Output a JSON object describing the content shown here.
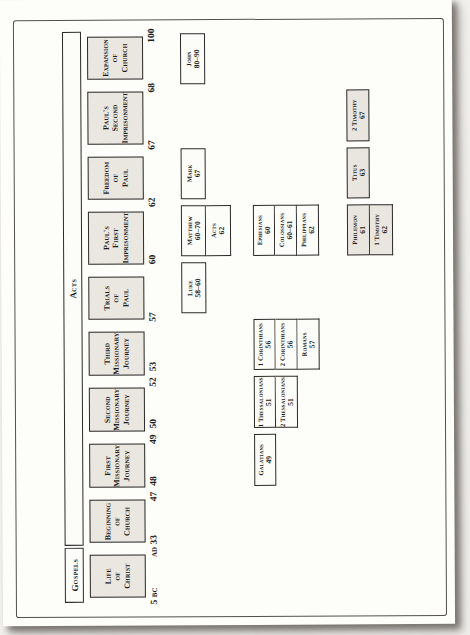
{
  "bars": {
    "gospels": "Gospels",
    "acts": "Acts"
  },
  "eras": [
    {
      "label": "Life\nof\nChrist"
    },
    {
      "label": "Beginning\nof\nChurch"
    },
    {
      "label": "First\nMissionary\nJourney"
    },
    {
      "label": "Second\nMissionary\nJourney"
    },
    {
      "label": "Third\nMissionary\nJourney"
    },
    {
      "label": "Trials\nof\nPaul"
    },
    {
      "label": "Paul's\nFirst\nImprisonment"
    },
    {
      "label": "Freedom\nof\nPaul"
    },
    {
      "label": "Paul's\nSecond\nImprisonment"
    },
    {
      "label": "Expansion\nof\nChurch"
    }
  ],
  "axis": {
    "start": "5 BC",
    "b1": "AD 33",
    "b2a": "47",
    "b2b": "48",
    "b3a": "49",
    "b3b": "50",
    "b4a": "52",
    "b4b": "53",
    "b5": "57",
    "b6": "60",
    "b7": "62",
    "b8": "67",
    "b9": "68",
    "end": "100"
  },
  "books": {
    "luke": {
      "name": "Luke",
      "date": "58–60"
    },
    "matthew": {
      "name": "Matthew",
      "date": "60–70"
    },
    "acts": {
      "name": "Acts",
      "date": "62"
    },
    "mark": {
      "name": "Mark",
      "date": "67"
    },
    "john": {
      "name": "John",
      "date": "80–90"
    },
    "galatians": {
      "name": "Galatians",
      "date": "49"
    },
    "thessalonians1": {
      "name": "1 Thessalonians",
      "date": "51"
    },
    "thessalonians2": {
      "name": "2 Thessalonians",
      "date": "51"
    },
    "corinthians1": {
      "name": "1 Corinthians",
      "date": "56"
    },
    "corinthians2": {
      "name": "2 Corinthians",
      "date": "56"
    },
    "romans": {
      "name": "Romans",
      "date": "57"
    },
    "ephesians": {
      "name": "Ephesians",
      "date": "60"
    },
    "colossians": {
      "name": "Colossians",
      "date": "60–61"
    },
    "philippians": {
      "name": "Philippians",
      "date": "62"
    },
    "philemon": {
      "name": "Philemon",
      "date": "61"
    },
    "timothy1": {
      "name": "1 Timothy",
      "date": "62"
    },
    "titus": {
      "name": "Titus",
      "date": "63"
    },
    "timothy2": {
      "name": "2 Timothy",
      "date": "67"
    }
  },
  "colors": {
    "shaded_box": "#e9e6e0",
    "white_box": "#fcfcf8",
    "box_border": "#2b2a28",
    "page": "#fdfdfa",
    "frame_border": "#54514b"
  }
}
